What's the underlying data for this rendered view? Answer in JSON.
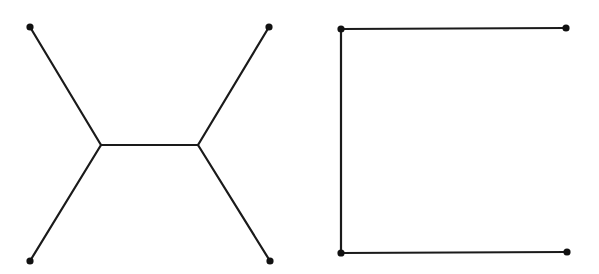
{
  "diagram": {
    "stroke_color": "#1a1a1a",
    "node_color": "#111111",
    "background": "#ffffff",
    "graphs": [
      {
        "name": "steiner-tree-h-shape",
        "terminals": [
          {
            "id": "tl",
            "x": 30,
            "y": 27
          },
          {
            "id": "tr",
            "x": 269,
            "y": 27
          },
          {
            "id": "bl",
            "x": 30,
            "y": 261
          },
          {
            "id": "br",
            "x": 270,
            "y": 261
          }
        ],
        "steiner_points": [
          {
            "id": "s1",
            "x": 101,
            "y": 145
          },
          {
            "id": "s2",
            "x": 198,
            "y": 145
          }
        ],
        "edges": [
          [
            "tl",
            "s1"
          ],
          [
            "bl",
            "s1"
          ],
          [
            "s1",
            "s2"
          ],
          [
            "s2",
            "tr"
          ],
          [
            "s2",
            "br"
          ]
        ]
      },
      {
        "name": "spanning-tree-bracket",
        "terminals": [
          {
            "id": "tl",
            "x": 341,
            "y": 29
          },
          {
            "id": "tr",
            "x": 566,
            "y": 28
          },
          {
            "id": "bl",
            "x": 341,
            "y": 253
          },
          {
            "id": "br",
            "x": 567,
            "y": 252
          }
        ],
        "edges": [
          [
            "tl",
            "tr"
          ],
          [
            "tl",
            "bl"
          ],
          [
            "bl",
            "br"
          ]
        ]
      }
    ]
  }
}
